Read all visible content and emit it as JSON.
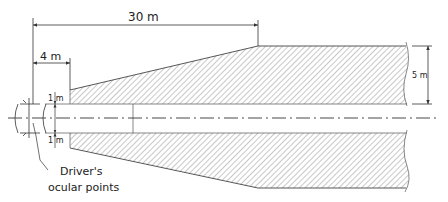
{
  "diagram": {
    "type": "road-visibility-zone",
    "labels": {
      "dim_total": "30 m",
      "dim_near": "4 m",
      "dim_width": "5 m",
      "dim_offset_top": "1 m",
      "dim_offset_bottom": "1 m",
      "caption_line1": "Driver's",
      "caption_line2": "ocular points"
    },
    "colors": {
      "line": "#333333",
      "hatch": "#8a8a8a",
      "background": "#ffffff"
    }
  }
}
